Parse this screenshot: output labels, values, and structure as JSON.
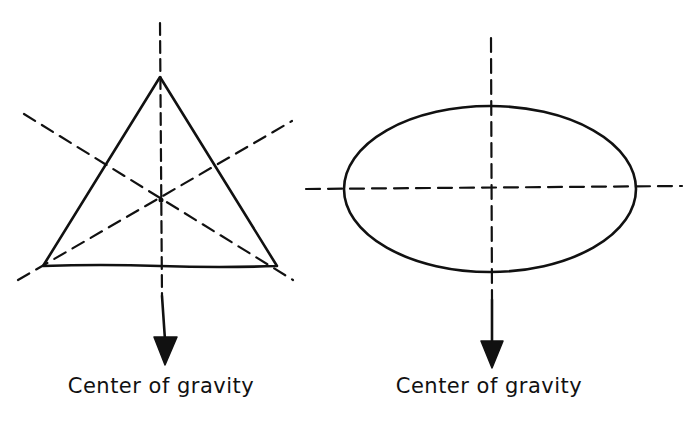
{
  "colors": {
    "ink": "#111111",
    "background": "#ffffff"
  },
  "figures": [
    {
      "shape": "triangle",
      "description": "Triangle with three dashed medians intersecting at the centroid; arrow points down from centroid",
      "label": "Center of gravity",
      "arrow_icon": "down-arrow"
    },
    {
      "shape": "ellipse",
      "description": "Ellipse with dashed horizontal and vertical axes crossing at the center; arrow points down from center",
      "label": "Center of gravity",
      "arrow_icon": "down-arrow"
    }
  ]
}
